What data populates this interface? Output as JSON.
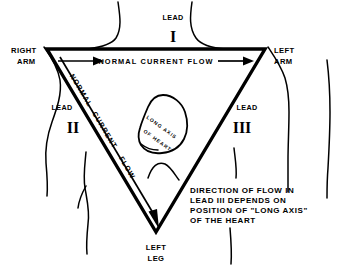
{
  "figure": {
    "ink_color": "#000000",
    "background_color": "#ffffff"
  },
  "labels": {
    "right_arm_line1": "RIGHT",
    "right_arm_line2": "ARM",
    "left_arm_line1": "LEFT",
    "left_arm_line2": "ARM",
    "left_leg_line1": "LEFT",
    "left_leg_line2": "LEG",
    "lead_word_top": "LEAD",
    "lead_numeral_top": "I",
    "lead_word_left": "LEAD",
    "lead_numeral_left": "II",
    "lead_word_right": "LEAD",
    "lead_numeral_right": "III",
    "flow_top": "NORMAL CURRENT FLOW",
    "flow_diagonal_line1": "NORMAL",
    "flow_diagonal_line2": "CURRENT",
    "flow_diagonal_line3": "FLOW",
    "heart_line1": "LONG AXIS",
    "heart_line2": "OF HEART"
  },
  "note": {
    "line1": "DIRECTION OF FLOW IN",
    "line2": "LEAD III  DEPENDS ON",
    "line3": "POSITION OF \"LONG AXIS\"",
    "line4": "OF THE HEART"
  },
  "geometry": {
    "vertex_right_arm": "47,49",
    "vertex_left_arm": "265,49",
    "vertex_left_leg": "156,232"
  }
}
